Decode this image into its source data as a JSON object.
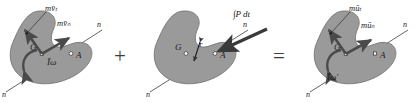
{
  "figure": {
    "type": "physics-vector-diagram",
    "background_color": "#ffffff",
    "body_fill_color": "#9a9a9a",
    "body_stroke_color": "#6e6e6e",
    "arrow_color": "#4a4a4a",
    "text_color": "#1a1a1a",
    "operators": {
      "plus": "+",
      "equals": "="
    },
    "panels": [
      {
        "id": "initial-momentum",
        "name": "initial-momentum-panel",
        "labels": {
          "centroid": "G",
          "contact_point": "A",
          "axis_top": "n",
          "axis_bottom": "n",
          "momentum_t": "mv̄ₜ",
          "momentum_n": "mv̄ₙ",
          "angular_momentum": "Īω"
        }
      },
      {
        "id": "impulse",
        "name": "impulse-panel",
        "labels": {
          "centroid": "G",
          "contact_point": "A",
          "axis_top": "n",
          "axis_bottom": "n",
          "impulse": "∫P dt",
          "moment_arm": "r"
        }
      },
      {
        "id": "final-momentum",
        "name": "final-momentum-panel",
        "labels": {
          "centroid": "G",
          "contact_point": "A",
          "axis_top": "n",
          "axis_bottom": "n",
          "momentum_t": "mūₜ",
          "momentum_n": "mūₙ",
          "angular_momentum": "Īω'"
        }
      }
    ]
  }
}
